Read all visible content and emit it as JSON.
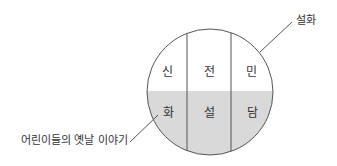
{
  "diagram": {
    "type": "venn-segmented-circle",
    "outer_label": "설화",
    "lower_label": "어린이들의 옛날 이야기",
    "columns": [
      {
        "top": "신",
        "bottom": "화"
      },
      {
        "top": "전",
        "bottom": "설"
      },
      {
        "top": "민",
        "bottom": "담"
      }
    ],
    "colors": {
      "stroke": "#555555",
      "shade": "#d9d9d9",
      "text": "#333333"
    }
  }
}
